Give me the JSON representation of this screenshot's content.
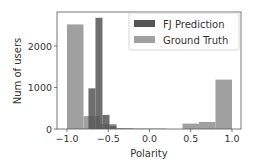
{
  "chart_data": {
    "type": "bar",
    "subtype": "histogram",
    "title": "",
    "xlabel": "Polarity",
    "ylabel": "Num of users",
    "xlim": [
      -1.12,
      1.1
    ],
    "ylim": [
      0,
      2800
    ],
    "xticks": [
      -1.0,
      -0.5,
      0.0,
      0.5,
      1.0
    ],
    "xtick_labels": [
      "−1.0",
      "−0.5",
      "0.0",
      "0.5",
      "1.0"
    ],
    "yticks": [
      0,
      1000,
      2000
    ],
    "ytick_labels": [
      "0",
      "1000",
      "2000"
    ],
    "grid": false,
    "legend_position": "upper right",
    "series": [
      {
        "name": "FJ Prediction",
        "color": "#555555",
        "bins": [
          {
            "x0": -0.74,
            "x1": -0.655,
            "value": 980
          },
          {
            "x0": -0.655,
            "x1": -0.57,
            "value": 2680
          },
          {
            "x0": -0.57,
            "x1": -0.485,
            "value": 340
          },
          {
            "x0": -0.485,
            "x1": -0.4,
            "value": 80
          },
          {
            "x0": -0.4,
            "x1": -0.315,
            "value": 10
          },
          {
            "x0": -0.315,
            "x1": 0.2,
            "value": 5
          }
        ]
      },
      {
        "name": "Ground Truth",
        "color": "#a0a0a0",
        "bins": [
          {
            "x0": -1.0,
            "x1": -0.8,
            "value": 2520
          },
          {
            "x0": -0.8,
            "x1": -0.6,
            "value": 310
          },
          {
            "x0": -0.6,
            "x1": -0.4,
            "value": 120
          },
          {
            "x0": -0.4,
            "x1": -0.2,
            "value": 20
          },
          {
            "x0": -0.2,
            "x1": 0.0,
            "value": 5
          },
          {
            "x0": 0.0,
            "x1": 0.2,
            "value": 5
          },
          {
            "x0": 0.2,
            "x1": 0.4,
            "value": 0
          },
          {
            "x0": 0.4,
            "x1": 0.6,
            "value": 130
          },
          {
            "x0": 0.6,
            "x1": 0.8,
            "value": 170
          },
          {
            "x0": 0.8,
            "x1": 1.0,
            "value": 1190
          }
        ]
      }
    ]
  }
}
